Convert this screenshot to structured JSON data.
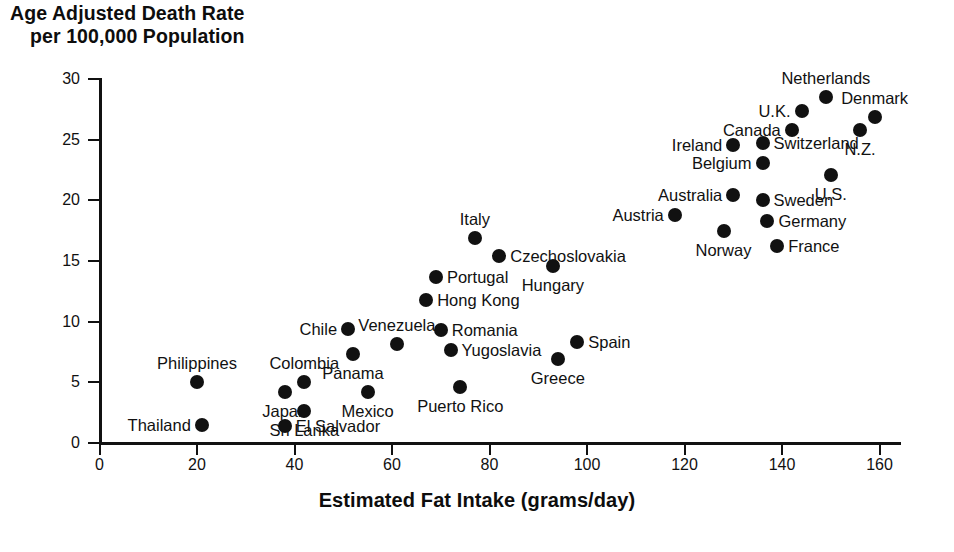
{
  "chart_data": {
    "type": "scatter",
    "title": "Age Adjusted Death Rate per 100,000 Population",
    "title_line_1": "Age Adjusted Death Rate",
    "title_line_2": "per 100,000 Population",
    "xlabel": "Estimated Fat Intake (grams/day)",
    "ylabel": "Age Adjusted Death Rate per 100,000 Population",
    "xlim": [
      0,
      165
    ],
    "ylim": [
      0,
      30
    ],
    "xticks": [
      0,
      20,
      40,
      60,
      80,
      100,
      120,
      140,
      160
    ],
    "yticks": [
      0,
      5,
      10,
      15,
      20,
      25,
      30
    ],
    "grid": false,
    "legend": "none",
    "marker_color": "#111111",
    "points": [
      {
        "label": "Netherlands",
        "x": 149,
        "y": 28.5,
        "label_pos": "above"
      },
      {
        "label": "U.K.",
        "x": 144,
        "y": 27.4,
        "label_pos": "left"
      },
      {
        "label": "Denmark",
        "x": 159,
        "y": 26.9,
        "label_pos": "above"
      },
      {
        "label": "Canada",
        "x": 142,
        "y": 25.8,
        "label_pos": "left"
      },
      {
        "label": "N.Z.",
        "x": 156,
        "y": 25.8,
        "label_pos": "below"
      },
      {
        "label": "Ireland",
        "x": 130,
        "y": 24.6,
        "label_pos": "left"
      },
      {
        "label": "Switzerland",
        "x": 136,
        "y": 24.7,
        "label_pos": "right"
      },
      {
        "label": "Belgium",
        "x": 136,
        "y": 23.1,
        "label_pos": "left"
      },
      {
        "label": "U.S.",
        "x": 150,
        "y": 22.1,
        "label_pos": "below"
      },
      {
        "label": "Australia",
        "x": 130,
        "y": 20.4,
        "label_pos": "left"
      },
      {
        "label": "Sweden",
        "x": 136,
        "y": 20.0,
        "label_pos": "right"
      },
      {
        "label": "Germany",
        "x": 137,
        "y": 18.3,
        "label_pos": "right"
      },
      {
        "label": "Austria",
        "x": 118,
        "y": 18.8,
        "label_pos": "left"
      },
      {
        "label": "Norway",
        "x": 128,
        "y": 17.5,
        "label_pos": "below"
      },
      {
        "label": "France",
        "x": 139,
        "y": 16.2,
        "label_pos": "right"
      },
      {
        "label": "Italy",
        "x": 77,
        "y": 16.9,
        "label_pos": "above"
      },
      {
        "label": "Czechoslovakia",
        "x": 82,
        "y": 15.4,
        "label_pos": "right"
      },
      {
        "label": "Hungary",
        "x": 93,
        "y": 14.6,
        "label_pos": "below"
      },
      {
        "label": "Portugal",
        "x": 69,
        "y": 13.7,
        "label_pos": "right"
      },
      {
        "label": "Hong Kong",
        "x": 67,
        "y": 11.8,
        "label_pos": "right"
      },
      {
        "label": "Chile",
        "x": 51,
        "y": 9.4,
        "label_pos": "left"
      },
      {
        "label": "Romania",
        "x": 70,
        "y": 9.3,
        "label_pos": "right"
      },
      {
        "label": "Venezuela",
        "x": 61,
        "y": 8.2,
        "label_pos": "above"
      },
      {
        "label": "Yugoslavia",
        "x": 72,
        "y": 7.7,
        "label_pos": "right"
      },
      {
        "label": "Spain",
        "x": 98,
        "y": 8.3,
        "label_pos": "right"
      },
      {
        "label": "Greece",
        "x": 94,
        "y": 6.9,
        "label_pos": "below"
      },
      {
        "label": "Panama",
        "x": 52,
        "y": 7.3,
        "label_pos": "below"
      },
      {
        "label": "Colombia",
        "x": 42,
        "y": 5.0,
        "label_pos": "above"
      },
      {
        "label": "Mexico",
        "x": 55,
        "y": 4.2,
        "label_pos": "below"
      },
      {
        "label": "Puerto Rico",
        "x": 74,
        "y": 4.6,
        "label_pos": "below"
      },
      {
        "label": "Philippines",
        "x": 20,
        "y": 5.0,
        "label_pos": "above"
      },
      {
        "label": "Japan",
        "x": 38,
        "y": 4.2,
        "label_pos": "below"
      },
      {
        "label": "Sri Lanka",
        "x": 42,
        "y": 2.6,
        "label_pos": "below"
      },
      {
        "label": "Thailand",
        "x": 21,
        "y": 1.5,
        "label_pos": "left"
      },
      {
        "label": "El Salvador",
        "x": 38,
        "y": 1.4,
        "label_pos": "right"
      }
    ]
  }
}
